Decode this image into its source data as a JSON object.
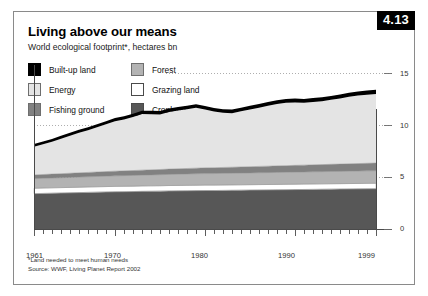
{
  "figure": {
    "number": "4.13",
    "title": "Living above our means",
    "subtitle": "World ecological footprint*, hectares bn",
    "footnote": "*Land needed to meet human needs",
    "source": "Source: WWF, Living Planet Report 2002"
  },
  "legend": {
    "left_column": [
      {
        "label": "Built-up land",
        "color": "#000000"
      },
      {
        "label": "Energy",
        "color": "#e4e4e4"
      },
      {
        "label": "Fishing ground",
        "color": "#818181"
      }
    ],
    "right_column": [
      {
        "label": "Forest",
        "color": "#b3b3b3"
      },
      {
        "label": "Grazing land",
        "color": "#ffffff"
      },
      {
        "label": "Cropland",
        "color": "#575757"
      }
    ]
  },
  "chart_data": {
    "type": "area",
    "stacked": true,
    "title": "Living above our means",
    "subtitle": "World ecological footprint*, hectares bn",
    "xlabel": "",
    "ylabel": "hectares bn",
    "xlim": [
      1961,
      1999
    ],
    "ylim": [
      0,
      15
    ],
    "yticks": [
      0,
      5,
      10,
      15
    ],
    "ytick_labels": [
      "0",
      "5",
      "10",
      "15"
    ],
    "xticks": [
      1961,
      1970,
      1980,
      1990,
      1999
    ],
    "xtick_labels": [
      "1961",
      "1970",
      "1980",
      "1990",
      "1999"
    ],
    "grid": "dotted-horizontal",
    "legend_position": "top-left",
    "x": [
      1961,
      1962,
      1963,
      1964,
      1965,
      1966,
      1967,
      1968,
      1969,
      1970,
      1971,
      1972,
      1973,
      1974,
      1975,
      1976,
      1977,
      1978,
      1979,
      1980,
      1981,
      1982,
      1983,
      1984,
      1985,
      1986,
      1987,
      1988,
      1989,
      1990,
      1991,
      1992,
      1993,
      1994,
      1995,
      1996,
      1997,
      1998,
      1999
    ],
    "series": [
      {
        "name": "Cropland",
        "color": "#575757",
        "values": [
          3.4,
          3.42,
          3.44,
          3.46,
          3.48,
          3.5,
          3.52,
          3.54,
          3.56,
          3.58,
          3.59,
          3.6,
          3.62,
          3.63,
          3.64,
          3.66,
          3.67,
          3.68,
          3.69,
          3.7,
          3.7,
          3.71,
          3.72,
          3.73,
          3.74,
          3.75,
          3.76,
          3.77,
          3.78,
          3.79,
          3.8,
          3.81,
          3.82,
          3.83,
          3.84,
          3.85,
          3.86,
          3.87,
          3.88
        ]
      },
      {
        "name": "Grazing land",
        "color": "#ffffff",
        "values": [
          0.52,
          0.52,
          0.52,
          0.52,
          0.52,
          0.52,
          0.52,
          0.52,
          0.52,
          0.52,
          0.52,
          0.52,
          0.52,
          0.52,
          0.52,
          0.52,
          0.52,
          0.52,
          0.52,
          0.52,
          0.52,
          0.52,
          0.52,
          0.52,
          0.52,
          0.52,
          0.52,
          0.52,
          0.52,
          0.52,
          0.52,
          0.52,
          0.52,
          0.52,
          0.52,
          0.52,
          0.52,
          0.52,
          0.52
        ]
      },
      {
        "name": "Forest",
        "color": "#b3b3b3",
        "values": [
          0.92,
          0.93,
          0.94,
          0.95,
          0.96,
          0.97,
          0.98,
          0.99,
          1.0,
          1.01,
          1.02,
          1.03,
          1.04,
          1.05,
          1.06,
          1.07,
          1.08,
          1.09,
          1.1,
          1.11,
          1.11,
          1.12,
          1.12,
          1.13,
          1.13,
          1.14,
          1.14,
          1.15,
          1.15,
          1.16,
          1.16,
          1.17,
          1.17,
          1.18,
          1.18,
          1.19,
          1.19,
          1.2,
          1.2
        ]
      },
      {
        "name": "Fishing ground",
        "color": "#818181",
        "values": [
          0.36,
          0.37,
          0.38,
          0.39,
          0.4,
          0.41,
          0.42,
          0.43,
          0.44,
          0.45,
          0.46,
          0.47,
          0.48,
          0.49,
          0.5,
          0.51,
          0.52,
          0.53,
          0.54,
          0.55,
          0.56,
          0.57,
          0.58,
          0.59,
          0.6,
          0.61,
          0.62,
          0.63,
          0.64,
          0.65,
          0.66,
          0.67,
          0.68,
          0.69,
          0.7,
          0.71,
          0.72,
          0.73,
          0.74
        ]
      },
      {
        "name": "Energy",
        "color": "#e4e4e4",
        "values": [
          2.7,
          2.9,
          3.1,
          3.35,
          3.6,
          3.85,
          4.05,
          4.3,
          4.55,
          4.8,
          4.95,
          5.15,
          5.4,
          5.35,
          5.3,
          5.5,
          5.6,
          5.7,
          5.8,
          5.6,
          5.4,
          5.25,
          5.2,
          5.35,
          5.5,
          5.65,
          5.8,
          5.95,
          6.05,
          6.05,
          6.0,
          6.05,
          6.1,
          6.2,
          6.3,
          6.45,
          6.55,
          6.6,
          6.65
        ]
      },
      {
        "name": "Built-up land",
        "color": "#000000",
        "values": [
          0.28,
          0.28,
          0.28,
          0.29,
          0.29,
          0.29,
          0.3,
          0.3,
          0.3,
          0.31,
          0.31,
          0.31,
          0.32,
          0.32,
          0.32,
          0.33,
          0.33,
          0.33,
          0.34,
          0.34,
          0.34,
          0.34,
          0.35,
          0.35,
          0.35,
          0.36,
          0.36,
          0.36,
          0.37,
          0.37,
          0.37,
          0.38,
          0.38,
          0.38,
          0.39,
          0.39,
          0.39,
          0.4,
          0.4
        ]
      }
    ],
    "totals": [
      8.18,
      8.42,
      8.66,
      8.96,
      9.25,
      9.54,
      9.79,
      10.08,
      10.37,
      10.67,
      10.85,
      11.08,
      11.38,
      11.36,
      11.34,
      11.59,
      11.72,
      11.85,
      11.99,
      11.82,
      11.63,
      11.51,
      11.49,
      11.67,
      11.84,
      12.03,
      12.2,
      12.38,
      12.51,
      12.54,
      12.51,
      12.6,
      12.67,
      12.8,
      12.93,
      13.11,
      13.23,
      13.32,
      13.39
    ]
  }
}
